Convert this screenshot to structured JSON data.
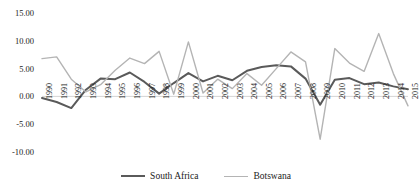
{
  "chart_data": {
    "type": "line",
    "title": "",
    "xlabel": "",
    "ylabel": "",
    "grid": false,
    "legend_position": "bottom",
    "ylim": [
      -10.0,
      15.0
    ],
    "yticks": [
      15.0,
      10.0,
      5.0,
      0.0,
      -5.0,
      -10.0
    ],
    "ytick_labels": [
      "15.00",
      "10.00",
      "5.00",
      "0.00",
      "-5.00",
      "-10.00"
    ],
    "categories": [
      "1990",
      "1991",
      "1992",
      "1993",
      "1994",
      "1995",
      "1996",
      "1997",
      "1998",
      "1999",
      "2000",
      "2001",
      "2002",
      "2003",
      "2004",
      "2005",
      "2006",
      "2007",
      "2008",
      "2009",
      "2010",
      "2011",
      "2012",
      "2013",
      "2014",
      "2015"
    ],
    "series": [
      {
        "name": "South Africa",
        "color": "#5a5a5a",
        "values": [
          -0.3,
          -1.0,
          -2.1,
          1.2,
          3.2,
          3.1,
          4.3,
          2.6,
          0.5,
          2.4,
          4.2,
          2.7,
          3.7,
          2.9,
          4.6,
          5.3,
          5.6,
          5.4,
          3.2,
          -1.5,
          3.0,
          3.3,
          2.2,
          2.5,
          1.8,
          1.3
        ]
      },
      {
        "name": "Botswana",
        "color": "#b4b4b4",
        "values": [
          6.8,
          7.1,
          3.1,
          0.8,
          2.1,
          4.7,
          6.9,
          5.9,
          8.1,
          0.4,
          9.8,
          0.6,
          3.1,
          1.4,
          4.1,
          2.0,
          5.0,
          8.0,
          6.2,
          -7.7,
          8.6,
          6.0,
          4.5,
          11.3,
          4.1,
          -1.7
        ]
      }
    ]
  },
  "legend": {
    "entries": [
      {
        "label": "South Africa",
        "swatch": "line-swatch-dark"
      },
      {
        "label": "Botswana",
        "swatch": "line-swatch-light"
      }
    ]
  }
}
